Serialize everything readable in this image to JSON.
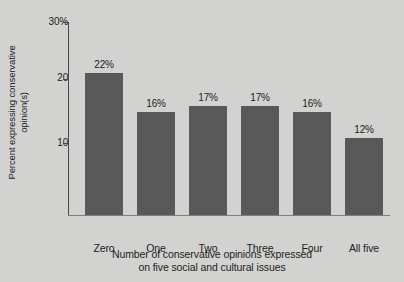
{
  "chart_data": {
    "type": "bar",
    "title": "",
    "subtitle": "",
    "categories": [
      "Zero",
      "One",
      "Two",
      "Three",
      "Four",
      "All five"
    ],
    "values": [
      22,
      16,
      17,
      17,
      16,
      12
    ],
    "data_labels": [
      "22%",
      "16%",
      "17%",
      "17%",
      "16%",
      "12%"
    ],
    "xlabel_line1": "Number of conservative opinions expressed",
    "xlabel_line2": "on five social and cultural issues",
    "ylabel_line1": "Percent expressing conservative",
    "ylabel_line2": "opinion(s)",
    "ylim": [
      0,
      30
    ],
    "yticks": [
      10,
      20,
      30
    ],
    "ytick_labels": [
      "10",
      "20",
      "30%"
    ],
    "grid": false,
    "legend": "none",
    "bar_color": "#595959",
    "background_color": "#d2d2d0",
    "text_color": "#1d1d1d",
    "axis_color": "#4a4a4a"
  }
}
